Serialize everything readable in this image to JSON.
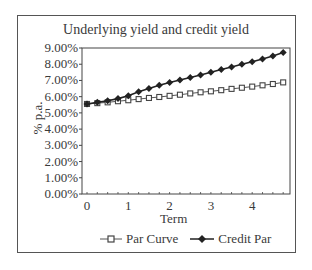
{
  "chart_data": {
    "type": "line",
    "title": "Underlying yield and credit yield",
    "xlabel": "Term",
    "ylabel": "% p.a.",
    "x_ticks": [
      "0",
      "1",
      "2",
      "3",
      "4"
    ],
    "y_ticks": [
      "0.00%",
      "1.00%",
      "2.00%",
      "3.00%",
      "4.00%",
      "5.00%",
      "6.00%",
      "7.00%",
      "8.00%",
      "9.00%"
    ],
    "ylim": [
      0,
      9
    ],
    "xlim": [
      -0.1,
      4.9
    ],
    "grid": false,
    "legend_position": "bottom",
    "x": [
      0,
      0.25,
      0.5,
      0.75,
      1.0,
      1.25,
      1.5,
      1.75,
      2.0,
      2.25,
      2.5,
      2.75,
      3.0,
      3.25,
      3.5,
      3.75,
      4.0,
      4.25,
      4.5,
      4.75
    ],
    "series": [
      {
        "name": "Par Curve",
        "marker": "square-open",
        "color": "#555555",
        "values": [
          5.55,
          5.6,
          5.65,
          5.72,
          5.78,
          5.85,
          5.92,
          5.98,
          6.05,
          6.12,
          6.2,
          6.27,
          6.33,
          6.4,
          6.48,
          6.55,
          6.62,
          6.7,
          6.78,
          6.88
        ]
      },
      {
        "name": "Credit Par",
        "marker": "diamond-filled",
        "color": "#222222",
        "values": [
          5.55,
          5.65,
          5.75,
          5.88,
          6.05,
          6.3,
          6.5,
          6.7,
          6.87,
          7.03,
          7.18,
          7.33,
          7.5,
          7.67,
          7.83,
          8.0,
          8.15,
          8.32,
          8.5,
          8.72
        ]
      }
    ]
  }
}
